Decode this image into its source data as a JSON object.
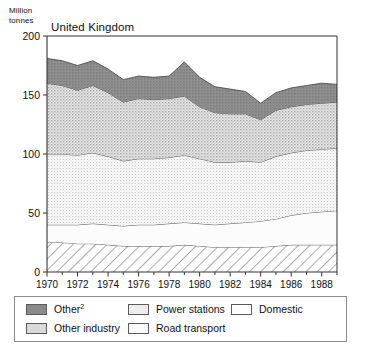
{
  "chart_data": {
    "type": "area",
    "title": "United Kingdom",
    "ylabel": "Million\ntonnes",
    "ylabel_line1": "Million",
    "ylabel_line2": "tonnes",
    "xlabel": "",
    "ylim": [
      0,
      200
    ],
    "xlim": [
      1970,
      1989
    ],
    "yticks": [
      0,
      50,
      100,
      150,
      200
    ],
    "xticks": [
      1970,
      1972,
      1974,
      1976,
      1978,
      1980,
      1982,
      1984,
      1986,
      1988
    ],
    "xtick_minor_step": 1,
    "grid": false,
    "legend_position": "below-plot",
    "stacked": true,
    "stack_order_bottom_to_top": [
      "Domestic",
      "Road transport",
      "Power stations",
      "Other industry",
      "Other²"
    ],
    "x": [
      1970,
      1971,
      1972,
      1973,
      1974,
      1975,
      1976,
      1977,
      1978,
      1979,
      1980,
      1981,
      1982,
      1983,
      1984,
      1985,
      1986,
      1987,
      1988,
      1989
    ],
    "series": [
      {
        "name": "Domestic",
        "pattern": "diagonal-hatch",
        "color": "#ffffff",
        "values": [
          25,
          25,
          24,
          24,
          23,
          22,
          22,
          22,
          22,
          23,
          22,
          21,
          21,
          21,
          21,
          22,
          23,
          23,
          23,
          23
        ]
      },
      {
        "name": "Road transport",
        "pattern": "solid",
        "color": "#fbfbfb",
        "values": [
          15,
          15,
          16,
          17,
          17,
          17,
          18,
          18,
          19,
          19,
          19,
          19,
          20,
          21,
          22,
          23,
          25,
          27,
          28,
          29
        ]
      },
      {
        "name": "Power stations",
        "pattern": "fine-dots-light",
        "color": "#ededed",
        "values": [
          60,
          60,
          59,
          60,
          58,
          55,
          56,
          56,
          56,
          57,
          55,
          53,
          52,
          52,
          50,
          53,
          53,
          53,
          53,
          53
        ]
      },
      {
        "name": "Other industry",
        "pattern": "dots-medium",
        "color": "#d9d9d9",
        "values": [
          60,
          58,
          55,
          57,
          54,
          50,
          51,
          50,
          50,
          50,
          44,
          42,
          41,
          40,
          36,
          39,
          39,
          39,
          39,
          39
        ]
      },
      {
        "name": "Other²",
        "pattern": "solid-dark",
        "color": "#8a8a8a",
        "values": [
          21,
          21,
          21,
          21,
          20,
          19,
          19,
          19,
          19,
          29,
          25,
          22,
          21,
          19,
          14,
          15,
          16,
          16,
          17,
          15
        ]
      }
    ],
    "totals": [
      181,
      179,
      175,
      179,
      172,
      163,
      166,
      165,
      166,
      178,
      165,
      157,
      155,
      153,
      143,
      152,
      156,
      158,
      160,
      159
    ]
  },
  "legend": {
    "items": [
      {
        "label": "Other",
        "sup": "2",
        "swatch": "other-swatch"
      },
      {
        "label": "Other industry",
        "sup": "",
        "swatch": "other-industry-swatch"
      },
      {
        "label": "Power stations",
        "sup": "",
        "swatch": "power-stations-swatch"
      },
      {
        "label": "Road transport",
        "sup": "",
        "swatch": "road-transport-swatch"
      },
      {
        "label": "Domestic",
        "sup": "",
        "swatch": "domestic-swatch"
      }
    ]
  },
  "colors": {
    "other": "#8a8a8a",
    "other_industry": "#d9d9d9",
    "power_stations": "#ededed",
    "road_transport": "#fbfbfb",
    "domestic": "#ffffff",
    "axis": "#333333",
    "text": "#111111"
  }
}
